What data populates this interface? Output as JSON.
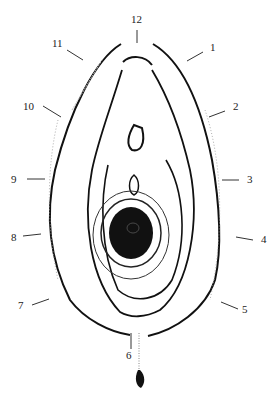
{
  "diagram": {
    "type": "clock-position line drawing",
    "stroke_color": "#111111",
    "background": "#ffffff",
    "labels": [
      {
        "text": "12",
        "x": 131,
        "y": 14
      },
      {
        "text": "1",
        "x": 210,
        "y": 42
      },
      {
        "text": "2",
        "x": 233,
        "y": 101
      },
      {
        "text": "3",
        "x": 247,
        "y": 174
      },
      {
        "text": "4",
        "x": 261,
        "y": 234
      },
      {
        "text": "5",
        "x": 242,
        "y": 304
      },
      {
        "text": "6",
        "x": 126,
        "y": 350
      },
      {
        "text": "7",
        "x": 18,
        "y": 300
      },
      {
        "text": "8",
        "x": 11,
        "y": 232
      },
      {
        "text": "9",
        "x": 11,
        "y": 174
      },
      {
        "text": "10",
        "x": 23,
        "y": 101
      },
      {
        "text": "11",
        "x": 52,
        "y": 38
      }
    ]
  }
}
